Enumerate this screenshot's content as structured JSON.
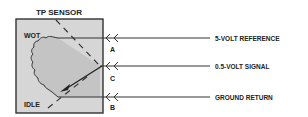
{
  "title": "TP SENSOR",
  "sensor_labels": {
    "wot": "WOT",
    "idle": "IDLE"
  },
  "terminals": [
    {
      "id": "A",
      "wire_label": "5-VOLT REFERENCE"
    },
    {
      "id": "C",
      "wire_label": "0.5-VOLT SIGNAL"
    },
    {
      "id": "B",
      "wire_label": "GROUND RETURN"
    }
  ],
  "colors": {
    "sensor_fill": "#d4d4d4",
    "resistor_fill": "#c8c8c8",
    "line": "#222222"
  }
}
